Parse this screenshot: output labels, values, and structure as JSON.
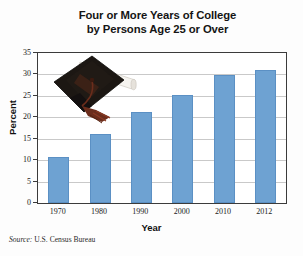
{
  "chart_data": {
    "type": "bar",
    "title": "Four or More Years of College by Persons Age 25 or Over",
    "title_lines": [
      "Four or More Years of College",
      "by Persons Age 25 or Over"
    ],
    "xlabel": "Year",
    "ylabel": "Percent",
    "categories": [
      "1970",
      "1980",
      "1990",
      "2000",
      "2010",
      "2012"
    ],
    "values": [
      10.7,
      16.2,
      21.3,
      25.2,
      29.8,
      31.0
    ],
    "ylim": [
      0,
      35
    ],
    "yticks": [
      0,
      5,
      10,
      15,
      20,
      25,
      30,
      35
    ],
    "ytick_labels": [
      "0",
      "5",
      "10",
      "15",
      "20",
      "25",
      "30",
      "35"
    ],
    "grid": "horizontal",
    "legend": "none",
    "series_color": "#6ea2d2",
    "source": "Source: U.S. Census Bureau",
    "source_prefix": "Source:",
    "source_body": " U.S. Census Bureau",
    "annotation_image": "graduation-cap-and-diploma"
  },
  "colors": {
    "bar": "#6ea2d2",
    "bar_edge": "#5b90c4",
    "axis": "#3b3b3b",
    "grid": "#c9c9c9",
    "text": "#151515",
    "background": "#fdfdfd",
    "cap": "#1c1713",
    "tassel": "#6b2d1c",
    "diploma": "#f4f2ee",
    "ribbon": "#c4622f"
  }
}
